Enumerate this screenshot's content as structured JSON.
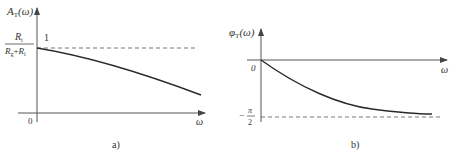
{
  "figure_a": {
    "caption": "a)",
    "y_label_main": "A",
    "y_label_sub": "T",
    "y_label_arg": "(ω)",
    "x_label": "ω",
    "origin_label": "0",
    "level_label": "1",
    "fraction_numerator_main": "R",
    "fraction_numerator_sub": "i",
    "fraction_denominator_g_main": "R",
    "fraction_denominator_g_sub": "g",
    "fraction_plus": "+",
    "fraction_denominator_i_main": "R",
    "fraction_denominator_i_sub": "i",
    "description": "Amplitude response decreasing monotonically from Ri/(Rg+Ri) as ω increases"
  },
  "figure_b": {
    "caption": "b)",
    "y_label_main": "φ",
    "y_label_sub": "T",
    "y_label_arg": "(ω)",
    "x_label": "ω",
    "origin_label": "0",
    "asymptote_minus": "−",
    "asymptote_num": "π",
    "asymptote_den": "2",
    "description": "Phase response starting at 0 and approaching −π/2 asymptotically"
  },
  "colors": {
    "line": "#2a2a2a",
    "axis": "#555555",
    "dash": "#666666"
  }
}
